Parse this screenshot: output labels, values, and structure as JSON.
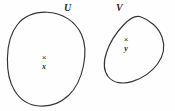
{
  "figure": {
    "type": "set-diagram",
    "background_color": "#fefefe",
    "stroke_color": "#333132",
    "width": 175,
    "height": 111,
    "regions": [
      {
        "id": "U",
        "label": "U",
        "shape": "closed-blob",
        "label_position": "top-right-outside"
      },
      {
        "id": "V",
        "label": "V",
        "shape": "tilted-ellipse",
        "label_position": "top-left-outside"
      }
    ],
    "points": [
      {
        "id": "x",
        "marker": "times-marker",
        "marker_glyph": "×",
        "label": "x",
        "inside_region": "U"
      },
      {
        "id": "y",
        "marker": "times-marker",
        "marker_glyph": "×",
        "label": "y",
        "inside_region": "V"
      }
    ]
  }
}
